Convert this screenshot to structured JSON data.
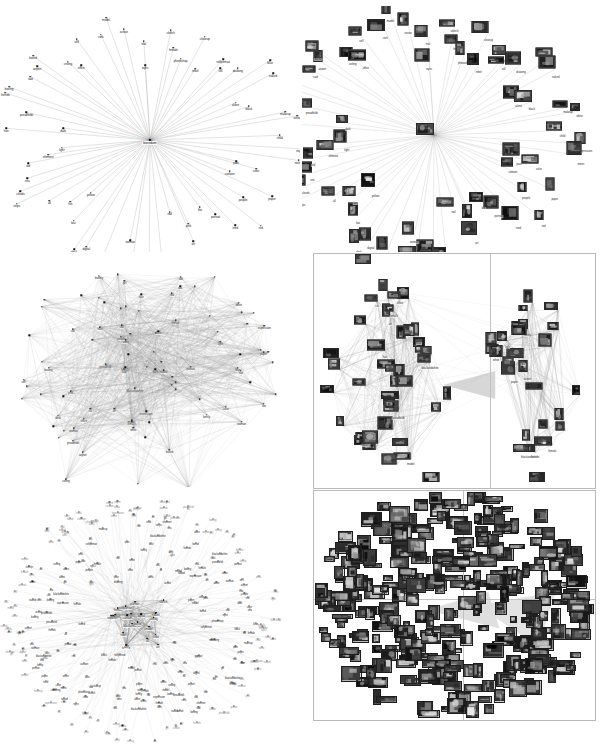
{
  "figure": {
    "title": "",
    "background_color": "#ffffff",
    "layout": "2 columns x 3 rows of network graph panels",
    "columns": [
      "tag-label graphs",
      "image-thumbnail graphs"
    ],
    "frame_color": "#b9b9b9"
  },
  "panels": [
    {
      "id": "top-left",
      "name": "ego-network-tags",
      "type": "star",
      "framed": false,
      "hub_label": "boredom",
      "description": "single hub with radial spokes to tag nodes"
    },
    {
      "id": "top-right",
      "name": "ego-network-images",
      "type": "star",
      "framed": false,
      "hub_label": "boredom",
      "description": "same star layout with photo thumbnails at each node"
    },
    {
      "id": "mid-left",
      "name": "dense-network-tags",
      "type": "hairball",
      "framed": false,
      "description": "dense many-to-many tag graph"
    },
    {
      "id": "mid-right",
      "name": "clustered-network-images",
      "type": "two-cluster",
      "framed": true,
      "description": "two photo clusters separated by a vertical divider"
    },
    {
      "id": "bottom-left",
      "name": "large-radial-network-tags",
      "type": "radial-dense",
      "framed": false,
      "description": "hundreds of tag labels radiating from a dense core"
    },
    {
      "id": "bottom-right",
      "name": "image-collage-network",
      "type": "collage",
      "framed": true,
      "description": "dense collage of photo thumbnails in a quadrant-divided frame"
    }
  ],
  "chart_data": {
    "type": "scatter",
    "xlabel": "",
    "ylabel": "",
    "legend": [],
    "star_tags": [
      "eyes",
      "sketch",
      "female",
      "photoshop",
      "closeup",
      "rebel",
      "selfportrait",
      "still",
      "drawing",
      "blue",
      "naked",
      "alone",
      "black",
      "makeup",
      "white",
      "child",
      "expression",
      "mens",
      "pain",
      "color",
      "cartoon",
      "paper",
      "people",
      "red",
      "tired",
      "portrait",
      "bw",
      "pink",
      "art",
      "nail",
      "blackandwhite",
      "girl",
      "face",
      "woman",
      "lonely",
      "digital",
      "desk",
      "bar",
      "yellow",
      "fun",
      "all",
      "strips",
      "clouds",
      "sea",
      "old",
      "element",
      "light",
      "hair",
      "dark",
      "proudfeldt",
      "friends",
      "boxing",
      "sad",
      "airport",
      "bored",
      "ceiling",
      "office",
      "self",
      "cork",
      "model",
      "ocean",
      "trial"
    ],
    "hub": "boredom",
    "star_node_count": 62,
    "dense_tags": [
      "proudfeldt",
      "naked",
      "boxing",
      "female",
      "expression",
      "bw",
      "female",
      "girl",
      "face",
      "blackandwhite",
      "cat",
      "portrait",
      "white",
      "art",
      "woman",
      "lonely",
      "ceiling",
      "alone",
      "airport",
      "office",
      "desk",
      "paper",
      "people",
      "self",
      "red",
      "blue",
      "pink",
      "light",
      "model",
      "sea",
      "old",
      "hair",
      "dark",
      "bored",
      "sad",
      "still",
      "color"
    ],
    "panel_counts": {
      "star_panel_nodes": 62,
      "dense_panel_nodes": 90,
      "cluster_panel_nodes": 62,
      "radial_panel_nodes": 420,
      "collage_panel_tiles": 330
    }
  }
}
